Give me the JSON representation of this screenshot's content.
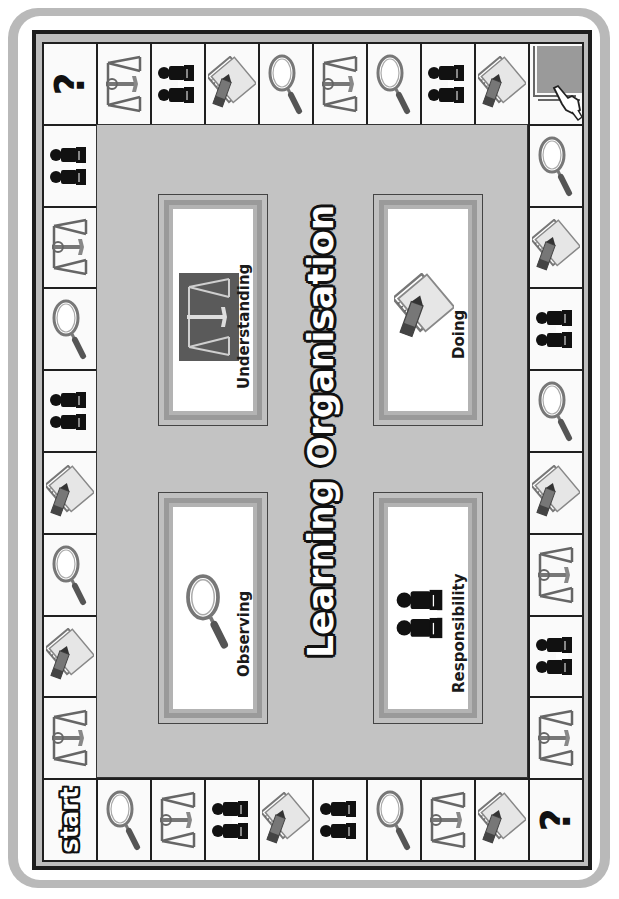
{
  "title": "Learning Organisation",
  "colors": {
    "frame": "#b9b9b9",
    "board_border": "#1d1d1d",
    "center": "#c3c3c3",
    "cell": "#fafafa",
    "pointer_square": "#9a9a9a"
  },
  "corners": {
    "top_left": {
      "type": "question",
      "label": "?"
    },
    "top_right": {
      "type": "hand-pointer"
    },
    "bottom_left": {
      "type": "start",
      "label": "start"
    },
    "bottom_right": {
      "type": "question",
      "label": "?"
    }
  },
  "top_row": [
    "scales",
    "people",
    "notepad",
    "magnifier",
    "scales",
    "magnifier",
    "people",
    "notepad"
  ],
  "bottom_row": [
    "magnifier",
    "scales",
    "people",
    "notepad",
    "people",
    "magnifier",
    "scales",
    "notepad"
  ],
  "left_column": [
    "people",
    "scales",
    "magnifier",
    "people",
    "notepad",
    "magnifier",
    "notepad",
    "scales"
  ],
  "right_column": [
    "magnifier",
    "notepad",
    "people",
    "magnifier",
    "notepad",
    "scales",
    "people",
    "scales"
  ],
  "cards": [
    {
      "position": "top-left",
      "label": "Understanding",
      "icon": "scales"
    },
    {
      "position": "top-right",
      "label": "Doing",
      "icon": "notepad"
    },
    {
      "position": "bottom-left",
      "label": "Observing",
      "icon": "magnifier"
    },
    {
      "position": "bottom-right",
      "label": "Responsibility",
      "icon": "people"
    }
  ]
}
